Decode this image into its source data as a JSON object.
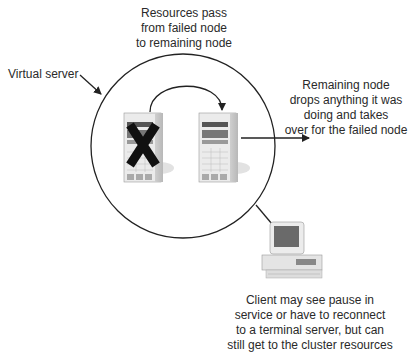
{
  "diagram": {
    "type": "cluster-failover",
    "labels": {
      "resources_pass": [
        "Resources pass",
        "from failed node",
        "to remaining node"
      ],
      "virtual_server": "Virtual server",
      "remaining_node": [
        "Remaining node",
        "drops anything it was",
        "doing and takes",
        "over for the failed node"
      ],
      "client": [
        "Client may see pause in",
        "service or have to reconnect",
        "to a terminal server, but can",
        "still get to the cluster resources"
      ]
    },
    "nodes": [
      {
        "id": "failed-node",
        "status": "failed",
        "marker": "X"
      },
      {
        "id": "remaining-node",
        "status": "active"
      },
      {
        "id": "client-computer",
        "status": "client"
      }
    ],
    "colors": {
      "line": "#222222",
      "server_body": "#e6e6e6",
      "x_mark": "#111111"
    }
  }
}
